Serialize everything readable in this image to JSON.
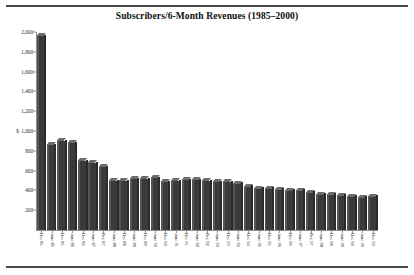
{
  "chart_data": {
    "type": "bar",
    "title": "Subscribers/6-Month Revenues (1985–2000)",
    "xlabel": "",
    "ylabel": "",
    "ylim": [
      0,
      2000
    ],
    "grid": false,
    "legend": "none",
    "currency_symbol": "$",
    "currency_tick": "1,000",
    "yticks": [
      "2,000",
      "1,800",
      "1,600",
      "1,400",
      "1,200",
      "1,000",
      "800",
      "600",
      "400",
      "200"
    ],
    "ytick_values": [
      2000,
      1800,
      1600,
      1400,
      1200,
      1000,
      800,
      600,
      400,
      200
    ],
    "categories": [
      "Dec 85",
      "June 85",
      "Dec 85",
      "June 86",
      "Dec 86",
      "June 87",
      "Dec 87",
      "June 88",
      "Dec 88",
      "June 89",
      "Dec 89",
      "June 90",
      "Dec 90",
      "June 91",
      "Dec 91",
      "June 92",
      "Dec 92",
      "June 93",
      "Dec 93",
      "June 94",
      "Dec 94",
      "June 95",
      "Dec 95",
      "June 96",
      "Dec 96",
      "June 97",
      "Dec 97",
      "June 98",
      "Dec 98",
      "June 99",
      "Dec 99",
      "June 00",
      "Dec 00"
    ],
    "values": [
      1960,
      860,
      900,
      880,
      700,
      680,
      640,
      500,
      500,
      520,
      520,
      530,
      490,
      500,
      510,
      510,
      500,
      490,
      490,
      470,
      440,
      420,
      420,
      410,
      400,
      400,
      380,
      360,
      360,
      350,
      340,
      330,
      340
    ]
  }
}
